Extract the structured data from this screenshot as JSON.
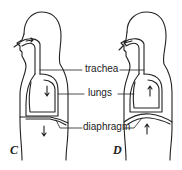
{
  "diagram": {
    "labels": {
      "trachea": "trachea",
      "lungs": "lungs",
      "diaphragm": "diaphragm"
    },
    "panels": [
      {
        "letter": "C",
        "phase": "inhalation",
        "arrow_direction": "down",
        "diaphragm_shape": "flattened"
      },
      {
        "letter": "D",
        "phase": "exhalation",
        "arrow_direction": "up",
        "diaphragm_shape": "domed"
      }
    ],
    "colors": {
      "line": "#222222",
      "background": "#ffffff"
    }
  }
}
